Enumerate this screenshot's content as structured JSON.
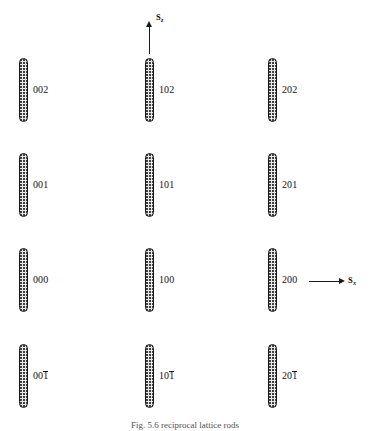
{
  "figure": {
    "background_color": "#ffffff",
    "rod_fill_color": "#e9e9e9",
    "rod_outline_color": "#161616",
    "text_color": "#111111"
  },
  "axes": {
    "vertical": {
      "name": "S_z",
      "symbol": "S",
      "subscript": "z",
      "direction": "up"
    },
    "horizontal": {
      "name": "S_x",
      "symbol": "S",
      "subscript": "x",
      "direction": "right"
    }
  },
  "columns": [
    {
      "index": 0,
      "h": "0"
    },
    {
      "index": 1,
      "h": "1"
    },
    {
      "index": 2,
      "h": "2"
    }
  ],
  "rows": [
    {
      "index": 0,
      "l": "2",
      "l_bar": false
    },
    {
      "index": 1,
      "l": "1",
      "l_bar": false
    },
    {
      "index": 2,
      "l": "0",
      "l_bar": false
    },
    {
      "index": 3,
      "l": "1",
      "l_bar": true
    }
  ],
  "rods": [
    {
      "id": "r0c0",
      "label_prefix": "00",
      "label_digit": "2",
      "overbar": false,
      "label": "002",
      "x": 19,
      "y": 58,
      "w": 9,
      "h": 64,
      "lx": 33,
      "ly": 85
    },
    {
      "id": "r0c1",
      "label_prefix": "10",
      "label_digit": "2",
      "overbar": false,
      "label": "102",
      "x": 145,
      "y": 58,
      "w": 9,
      "h": 64,
      "lx": 159,
      "ly": 85
    },
    {
      "id": "r0c2",
      "label_prefix": "20",
      "label_digit": "2",
      "overbar": false,
      "label": "202",
      "x": 268,
      "y": 58,
      "w": 9,
      "h": 64,
      "lx": 282,
      "ly": 85
    },
    {
      "id": "r1c0",
      "label_prefix": "00",
      "label_digit": "1",
      "overbar": false,
      "label": "001",
      "x": 19,
      "y": 153,
      "w": 9,
      "h": 64,
      "lx": 33,
      "ly": 180
    },
    {
      "id": "r1c1",
      "label_prefix": "10",
      "label_digit": "1",
      "overbar": false,
      "label": "101",
      "x": 145,
      "y": 153,
      "w": 9,
      "h": 64,
      "lx": 159,
      "ly": 180
    },
    {
      "id": "r1c2",
      "label_prefix": "20",
      "label_digit": "1",
      "overbar": false,
      "label": "201",
      "x": 268,
      "y": 153,
      "w": 9,
      "h": 64,
      "lx": 282,
      "ly": 180
    },
    {
      "id": "r2c0",
      "label_prefix": "00",
      "label_digit": "0",
      "overbar": false,
      "label": "000",
      "x": 19,
      "y": 248,
      "w": 9,
      "h": 64,
      "lx": 33,
      "ly": 275
    },
    {
      "id": "r2c1",
      "label_prefix": "10",
      "label_digit": "0",
      "overbar": false,
      "label": "100",
      "x": 145,
      "y": 248,
      "w": 9,
      "h": 64,
      "lx": 159,
      "ly": 275
    },
    {
      "id": "r2c2",
      "label_prefix": "20",
      "label_digit": "0",
      "overbar": false,
      "label": "200",
      "x": 268,
      "y": 248,
      "w": 9,
      "h": 64,
      "lx": 282,
      "ly": 275
    },
    {
      "id": "r3c0",
      "label_prefix": "00",
      "label_digit": "1",
      "overbar": true,
      "label": "001̅",
      "x": 19,
      "y": 344,
      "w": 9,
      "h": 64,
      "lx": 33,
      "ly": 371
    },
    {
      "id": "r3c1",
      "label_prefix": "10",
      "label_digit": "1",
      "overbar": true,
      "label": "101̅",
      "x": 145,
      "y": 344,
      "w": 9,
      "h": 64,
      "lx": 159,
      "ly": 371
    },
    {
      "id": "r3c2",
      "label_prefix": "20",
      "label_digit": "1",
      "overbar": true,
      "label": "201̅",
      "x": 268,
      "y": 344,
      "w": 9,
      "h": 64,
      "lx": 282,
      "ly": 371
    }
  ],
  "caption": {
    "text": "Fig. 5.6  reciprocal lattice rods"
  }
}
